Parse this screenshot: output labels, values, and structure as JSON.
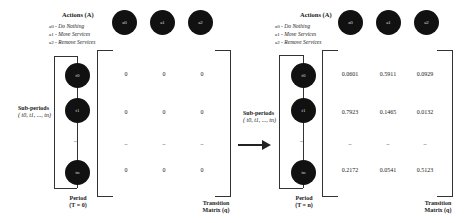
{
  "actions": {
    "title": "Actions (A)",
    "legend": [
      {
        "symbol": "a0",
        "label": "Do Nothing"
      },
      {
        "symbol": "a1",
        "label": "Move Services"
      },
      {
        "symbol": "a2",
        "label": "Remove Services"
      }
    ],
    "nodes": [
      "a0",
      "a1",
      "a2"
    ]
  },
  "subperiods": {
    "title": "Sub-periods",
    "range": "( t0, t1, ..., tn)",
    "nodes": [
      "t0",
      "t1",
      "tn"
    ],
    "ellipsis": "–"
  },
  "left": {
    "period_title": "Period",
    "period_value": "(T = 0)",
    "matrix": [
      [
        "0",
        "0",
        "0"
      ],
      [
        "0",
        "0",
        "0"
      ],
      [
        "–",
        "–",
        "–"
      ],
      [
        "0",
        "0",
        "0"
      ]
    ],
    "matrix_label_1": "Transition",
    "matrix_label_2": "Matrix (q)"
  },
  "right": {
    "period_title": "Period",
    "period_value": "(T = n)",
    "matrix": [
      [
        "0.0601",
        "0.5911",
        "0.0929"
      ],
      [
        "0.7923",
        "0.1465",
        "0.0132"
      ],
      [
        "–",
        "–",
        "–"
      ],
      [
        "0.2172",
        "0.0541",
        "0.5123"
      ]
    ],
    "matrix_label_1": "Transition",
    "matrix_label_2": "Matrix (q)"
  },
  "legend_prefix_sep": " - "
}
